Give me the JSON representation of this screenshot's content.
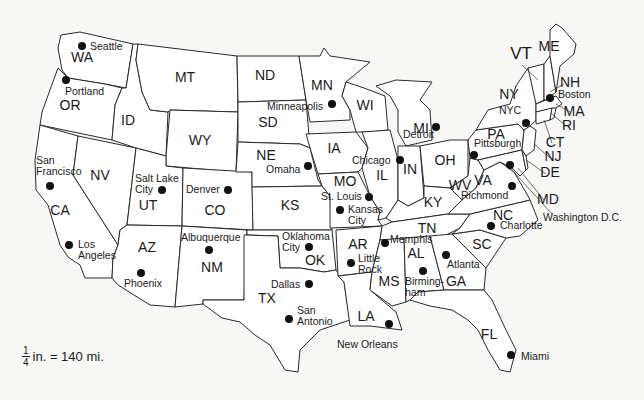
{
  "map": {
    "title": "United States",
    "scale": {
      "numerator": "1",
      "denominator": "4",
      "text": "in. = 140 mi."
    },
    "states": [
      {
        "abbr": "WA",
        "x": 82,
        "y": 62
      },
      {
        "abbr": "OR",
        "x": 70,
        "y": 110
      },
      {
        "abbr": "CA",
        "x": 60,
        "y": 215
      },
      {
        "abbr": "NV",
        "x": 100,
        "y": 180
      },
      {
        "abbr": "ID",
        "x": 128,
        "y": 125
      },
      {
        "abbr": "MT",
        "x": 185,
        "y": 82
      },
      {
        "abbr": "WY",
        "x": 200,
        "y": 145
      },
      {
        "abbr": "UT",
        "x": 148,
        "y": 210
      },
      {
        "abbr": "CO",
        "x": 215,
        "y": 215
      },
      {
        "abbr": "AZ",
        "x": 147,
        "y": 252
      },
      {
        "abbr": "NM",
        "x": 212,
        "y": 272
      },
      {
        "abbr": "ND",
        "x": 265,
        "y": 80
      },
      {
        "abbr": "SD",
        "x": 268,
        "y": 127
      },
      {
        "abbr": "NE",
        "x": 266,
        "y": 160
      },
      {
        "abbr": "KS",
        "x": 290,
        "y": 210
      },
      {
        "abbr": "OK",
        "x": 315,
        "y": 265
      },
      {
        "abbr": "TX",
        "x": 267,
        "y": 303
      },
      {
        "abbr": "MN",
        "x": 322,
        "y": 90
      },
      {
        "abbr": "IA",
        "x": 334,
        "y": 153
      },
      {
        "abbr": "MO",
        "x": 345,
        "y": 186
      },
      {
        "abbr": "AR",
        "x": 358,
        "y": 249
      },
      {
        "abbr": "LA",
        "x": 366,
        "y": 321
      },
      {
        "abbr": "WI",
        "x": 365,
        "y": 110
      },
      {
        "abbr": "IL",
        "x": 382,
        "y": 180
      },
      {
        "abbr": "MS",
        "x": 389,
        "y": 286
      },
      {
        "abbr": "MI",
        "x": 421,
        "y": 133
      },
      {
        "abbr": "IN",
        "x": 410,
        "y": 174
      },
      {
        "abbr": "KY",
        "x": 433,
        "y": 207
      },
      {
        "abbr": "TN",
        "x": 427,
        "y": 233
      },
      {
        "abbr": "AL",
        "x": 416,
        "y": 258
      },
      {
        "abbr": "GA",
        "x": 456,
        "y": 286
      },
      {
        "abbr": "FL",
        "x": 489,
        "y": 339
      },
      {
        "abbr": "OH",
        "x": 445,
        "y": 165
      },
      {
        "abbr": "WV",
        "x": 460,
        "y": 190
      },
      {
        "abbr": "VA",
        "x": 483,
        "y": 185
      },
      {
        "abbr": "NC",
        "x": 503,
        "y": 220
      },
      {
        "abbr": "SC",
        "x": 482,
        "y": 249
      },
      {
        "abbr": "PA",
        "x": 496,
        "y": 139
      },
      {
        "abbr": "NY",
        "x": 509,
        "y": 99
      },
      {
        "abbr": "VT",
        "x": 521,
        "y": 59,
        "big": true
      },
      {
        "abbr": "ME",
        "x": 549,
        "y": 51
      },
      {
        "abbr": "NH",
        "x": 570,
        "y": 87
      },
      {
        "abbr": "MA",
        "x": 574,
        "y": 116
      },
      {
        "abbr": "RI",
        "x": 569,
        "y": 130
      },
      {
        "abbr": "CT",
        "x": 555,
        "y": 147
      },
      {
        "abbr": "NJ",
        "x": 553,
        "y": 161
      },
      {
        "abbr": "DE",
        "x": 550,
        "y": 177
      },
      {
        "abbr": "MD",
        "x": 548,
        "y": 204
      }
    ],
    "cities": [
      {
        "name": "Seattle",
        "lines": [
          "Seattle"
        ],
        "dx": 82,
        "dy": 46,
        "lx": 90,
        "ly": 50
      },
      {
        "name": "Portland",
        "lines": [
          "Portland"
        ],
        "dx": 66,
        "dy": 80,
        "lx": 65,
        "ly": 95
      },
      {
        "name": "San Francisco",
        "lines": [
          "San",
          "Francisco"
        ],
        "dx": 50,
        "dy": 186,
        "lx": 36,
        "ly": 164
      },
      {
        "name": "Los Angeles",
        "lines": [
          "Los",
          "Angeles"
        ],
        "dx": 69,
        "dy": 245,
        "lx": 78,
        "ly": 248
      },
      {
        "name": "Salt Lake City",
        "lines": [
          "Salt Lake",
          "City"
        ],
        "dx": 162,
        "dy": 190,
        "lx": 135,
        "ly": 182
      },
      {
        "name": "Denver",
        "lines": [
          "Denver"
        ],
        "dx": 228,
        "dy": 190,
        "lx": 186,
        "ly": 193
      },
      {
        "name": "Albuquerque",
        "lines": [
          "Albuquerque"
        ],
        "dx": 209,
        "dy": 250,
        "lx": 181,
        "ly": 241
      },
      {
        "name": "Phoenix",
        "lines": [
          "Phoenix"
        ],
        "dx": 141,
        "dy": 273,
        "lx": 124,
        "ly": 287
      },
      {
        "name": "Minneapolis",
        "lines": [
          "Minneapolis"
        ],
        "dx": 332,
        "dy": 104,
        "lx": 267,
        "ly": 110
      },
      {
        "name": "Omaha",
        "lines": [
          "Omaha"
        ],
        "dx": 308,
        "dy": 166,
        "lx": 266,
        "ly": 173
      },
      {
        "name": "St. Louis",
        "lines": [
          "St. Louis"
        ],
        "dx": 369,
        "dy": 197,
        "lx": 321,
        "ly": 200
      },
      {
        "name": "Kansas City",
        "lines": [
          "Kansas",
          "City"
        ],
        "dx": 340,
        "dy": 210,
        "lx": 348,
        "ly": 213
      },
      {
        "name": "Chicago",
        "lines": [
          "Chicago"
        ],
        "dx": 400,
        "dy": 160,
        "lx": 352,
        "ly": 164
      },
      {
        "name": "Detroit",
        "lines": [
          "Detroit"
        ],
        "dx": 436,
        "dy": 127,
        "lx": 403,
        "ly": 138
      },
      {
        "name": "Oklahoma City",
        "lines": [
          "Oklahoma",
          "City"
        ],
        "dx": 309,
        "dy": 247,
        "lx": 282,
        "ly": 240
      },
      {
        "name": "Dallas",
        "lines": [
          "Dallas"
        ],
        "dx": 309,
        "dy": 284,
        "lx": 271,
        "ly": 288
      },
      {
        "name": "San Antonio",
        "lines": [
          "San",
          "Antonio"
        ],
        "dx": 289,
        "dy": 319,
        "lx": 297,
        "ly": 314
      },
      {
        "name": "Little Rock",
        "lines": [
          "Little",
          "Rock"
        ],
        "dx": 351,
        "dy": 263,
        "lx": 358,
        "ly": 262
      },
      {
        "name": "Memphis",
        "lines": [
          "Memphis"
        ],
        "dx": 385,
        "dy": 243,
        "lx": 390,
        "ly": 243
      },
      {
        "name": "New Orleans",
        "lines": [
          "New Orleans"
        ],
        "dx": 389,
        "dy": 324,
        "lx": 337,
        "ly": 348
      },
      {
        "name": "Birmingham",
        "lines": [
          "Birming-",
          "ham"
        ],
        "dx": 423,
        "dy": 271,
        "lx": 405,
        "ly": 285
      },
      {
        "name": "Atlanta",
        "lines": [
          "Atlanta"
        ],
        "dx": 446,
        "dy": 255,
        "lx": 447,
        "ly": 268
      },
      {
        "name": "Miami",
        "lines": [
          "Miami"
        ],
        "dx": 511,
        "dy": 355,
        "lx": 521,
        "ly": 360
      },
      {
        "name": "Pittsburgh",
        "lines": [
          "Pittsburgh"
        ],
        "dx": 474,
        "dy": 155,
        "lx": 474,
        "ly": 147
      },
      {
        "name": "Richmond",
        "lines": [
          "Richmond"
        ],
        "dx": 512,
        "dy": 186,
        "lx": 461,
        "ly": 199
      },
      {
        "name": "Charlotte",
        "lines": [
          "Charlotte"
        ],
        "dx": 491,
        "dy": 226,
        "lx": 500,
        "ly": 229
      },
      {
        "name": "Washington D.C.",
        "lines": [
          "Washington D.C."
        ],
        "dx": 510,
        "dy": 165,
        "lx": 543,
        "ly": 221
      },
      {
        "name": "NYC",
        "lines": [
          "NYC"
        ],
        "dx": 526,
        "dy": 123,
        "lx": 499,
        "ly": 114
      },
      {
        "name": "Boston",
        "lines": [
          "Boston"
        ],
        "dx": 550,
        "dy": 98,
        "lx": 558,
        "ly": 98
      }
    ]
  }
}
